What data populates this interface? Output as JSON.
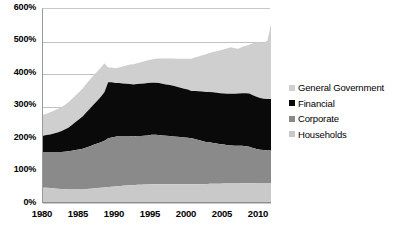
{
  "chart_data": {
    "type": "area",
    "stacked": true,
    "title": "",
    "subtitle": "",
    "xlabel": "",
    "ylabel": "",
    "ylim": [
      0,
      600
    ],
    "ytick_labels": [
      "0%",
      "100%",
      "200%",
      "300%",
      "400%",
      "500%",
      "600%"
    ],
    "ytick_values": [
      0,
      100,
      200,
      300,
      400,
      500,
      600
    ],
    "xlim": [
      1980,
      2011.5
    ],
    "xtick_labels": [
      "1980",
      "1985",
      "1990",
      "1995",
      "2000",
      "2005",
      "2010"
    ],
    "xtick_values": [
      1980,
      1985,
      1990,
      1995,
      2000,
      2005,
      2010
    ],
    "grid": true,
    "legend_position": "right",
    "value_unit": "percent",
    "x": [
      1980,
      1980.5,
      1981,
      1981.5,
      1982,
      1982.5,
      1983,
      1983.5,
      1984,
      1984.5,
      1985,
      1985.5,
      1986,
      1986.5,
      1987,
      1987.5,
      1988,
      1988.5,
      1989,
      1989.5,
      1990,
      1990.5,
      1991,
      1991.5,
      1992,
      1992.5,
      1993,
      1993.5,
      1994,
      1994.5,
      1995,
      1995.5,
      1996,
      1996.5,
      1997,
      1997.5,
      1998,
      1998.5,
      1999,
      1999.5,
      2000,
      2000.5,
      2001,
      2001.5,
      2002,
      2002.5,
      2003,
      2003.5,
      2004,
      2004.5,
      2005,
      2005.5,
      2006,
      2006.5,
      2007,
      2007.5,
      2008,
      2008.5,
      2009,
      2009.5,
      2010,
      2010.5,
      2011,
      2011.5
    ],
    "series": [
      {
        "name": "Households",
        "color": "#c9c9c9",
        "stack_order": 1,
        "values": [
          50,
          50,
          49,
          48,
          47,
          46,
          46,
          45,
          45,
          45,
          45,
          45,
          46,
          47,
          48,
          49,
          50,
          51,
          52,
          53,
          54,
          55,
          56,
          57,
          58,
          58,
          59,
          59,
          60,
          60,
          61,
          61,
          61,
          61,
          61,
          61,
          61,
          61,
          61,
          61,
          61,
          61,
          61,
          61,
          61,
          61,
          62,
          62,
          62,
          62,
          63,
          63,
          63,
          63,
          63,
          64,
          64,
          64,
          64,
          65,
          65,
          65,
          65,
          65
        ]
      },
      {
        "name": "Corporate",
        "color": "#8a8a8a",
        "stack_order": 2,
        "values": [
          110,
          110,
          111,
          112,
          113,
          114,
          115,
          117,
          119,
          121,
          123,
          125,
          128,
          131,
          134,
          137,
          140,
          144,
          150,
          152,
          153,
          154,
          153,
          152,
          151,
          150,
          150,
          150,
          150,
          151,
          152,
          152,
          151,
          150,
          149,
          148,
          147,
          146,
          145,
          144,
          143,
          141,
          139,
          136,
          133,
          130,
          128,
          126,
          124,
          122,
          120,
          118,
          117,
          116,
          116,
          115,
          114,
          112,
          108,
          104,
          102,
          101,
          100,
          100
        ]
      },
      {
        "name": "Financial",
        "color": "#0a0a0a",
        "stack_order": 3,
        "values": [
          50,
          52,
          54,
          57,
          60,
          64,
          68,
          73,
          79,
          86,
          93,
          100,
          108,
          116,
          124,
          132,
          140,
          150,
          173,
          170,
          165,
          163,
          162,
          161,
          160,
          160,
          160,
          161,
          161,
          161,
          160,
          160,
          160,
          159,
          158,
          157,
          156,
          154,
          152,
          150,
          148,
          146,
          148,
          150,
          152,
          154,
          155,
          156,
          156,
          157,
          157,
          158,
          159,
          160,
          161,
          162,
          163,
          164,
          163,
          161,
          159,
          158,
          158,
          158
        ]
      },
      {
        "name": "General Government",
        "color": "#cfcfcf",
        "stack_order": 4,
        "values": [
          65,
          66,
          68,
          70,
          72,
          74,
          76,
          78,
          80,
          82,
          84,
          86,
          88,
          89,
          90,
          90,
          90,
          88,
          45,
          45,
          46,
          48,
          52,
          56,
          60,
          62,
          64,
          66,
          68,
          70,
          72,
          74,
          76,
          78,
          80,
          82,
          84,
          86,
          89,
          92,
          95,
          99,
          103,
          107,
          112,
          116,
          120,
          124,
          128,
          132,
          136,
          140,
          143,
          140,
          138,
          142,
          146,
          150,
          160,
          168,
          170,
          172,
          180,
          230
        ]
      }
    ]
  },
  "legend": {
    "items": [
      {
        "label": "General Government",
        "color": "#cfcfcf"
      },
      {
        "label": "Financial",
        "color": "#0a0a0a"
      },
      {
        "label": "Corporate",
        "color": "#8a8a8a"
      },
      {
        "label": "Households",
        "color": "#c9c9c9"
      }
    ]
  },
  "axes": {
    "y_ticks": [
      "600%",
      "500%",
      "400%",
      "300%",
      "200%",
      "100%",
      "0%"
    ],
    "x_ticks": [
      "1980",
      "1985",
      "1990",
      "1995",
      "2000",
      "2005",
      "2010"
    ]
  },
  "colors": {
    "background": "#ffffff",
    "grid": "#c2c2c2",
    "axis": "#8f8f8f",
    "text": "#000000"
  }
}
